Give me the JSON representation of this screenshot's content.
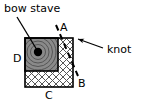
{
  "figure": {
    "title_label": "bow stave",
    "knot_label": "knot",
    "corner_labels": {
      "a": "A",
      "b": "B",
      "c": "C",
      "d": "D"
    },
    "icons": {
      "bow_stave_leader": "leader-line-icon",
      "knot_arrow": "arrow-left-icon",
      "split_line": "dashed-line-icon",
      "pith_dot": "filled-circle-icon",
      "growth_rings": "concentric-arcs-icon",
      "sapwood_hatch": "cross-hatch-icon"
    },
    "colors": {
      "background": "#ffffff",
      "outline": "#000000",
      "stave_fill": "#8a8a8a",
      "ring_line": "#4a4a4a",
      "hatch_line": "#555555",
      "pith": "#000000",
      "text": "#000000"
    },
    "geometry": {
      "log_square": {
        "x": 25,
        "y": 38,
        "width": 48,
        "height": 49
      },
      "stave_rect": {
        "x": 25,
        "y": 38,
        "width": 33,
        "height": 33
      },
      "pith_center": {
        "x": 38,
        "y": 52,
        "r": 4
      }
    }
  }
}
